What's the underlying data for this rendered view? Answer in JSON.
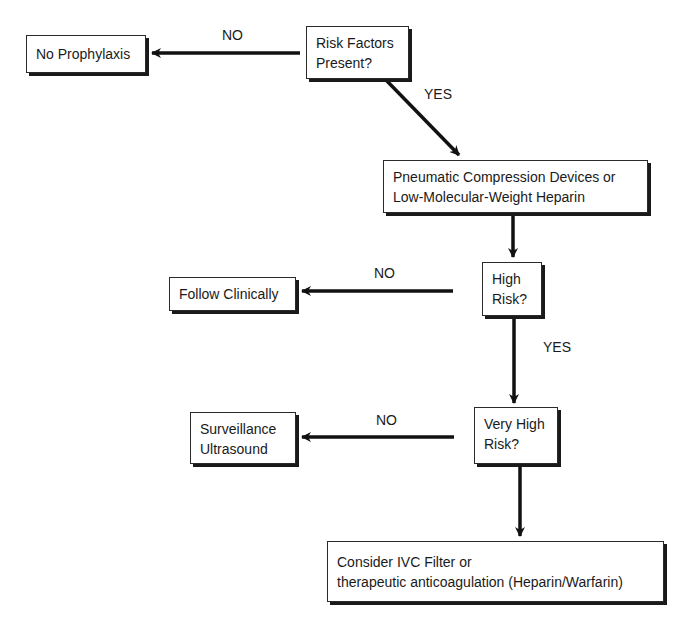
{
  "diagram": {
    "type": "flowchart",
    "nodes": {
      "risk_factors": {
        "lines": [
          "Risk Factors",
          "Present?"
        ]
      },
      "no_prophylaxis": {
        "lines": [
          "No Prophylaxis"
        ]
      },
      "pneumatic": {
        "lines": [
          "Pneumatic Compression Devices or",
          "Low-Molecular-Weight Heparin"
        ]
      },
      "high_risk": {
        "lines": [
          "High",
          "Risk?"
        ]
      },
      "follow_clinically": {
        "lines": [
          "Follow Clinically"
        ]
      },
      "very_high_risk": {
        "lines": [
          "Very High",
          "Risk?"
        ]
      },
      "surveillance": {
        "lines": [
          "Surveillance",
          "Ultrasound"
        ]
      },
      "ivc_filter": {
        "lines": [
          "Consider IVC Filter or",
          "therapeutic anticoagulation (Heparin/Warfarin)"
        ]
      }
    },
    "edges": [
      {
        "from": "risk_factors",
        "to": "no_prophylaxis",
        "label": "NO"
      },
      {
        "from": "risk_factors",
        "to": "pneumatic",
        "label": "YES"
      },
      {
        "from": "pneumatic",
        "to": "high_risk",
        "label": ""
      },
      {
        "from": "high_risk",
        "to": "follow_clinically",
        "label": "NO"
      },
      {
        "from": "high_risk",
        "to": "very_high_risk",
        "label": "YES"
      },
      {
        "from": "very_high_risk",
        "to": "surveillance",
        "label": "NO"
      },
      {
        "from": "very_high_risk",
        "to": "ivc_filter",
        "label": ""
      }
    ]
  }
}
